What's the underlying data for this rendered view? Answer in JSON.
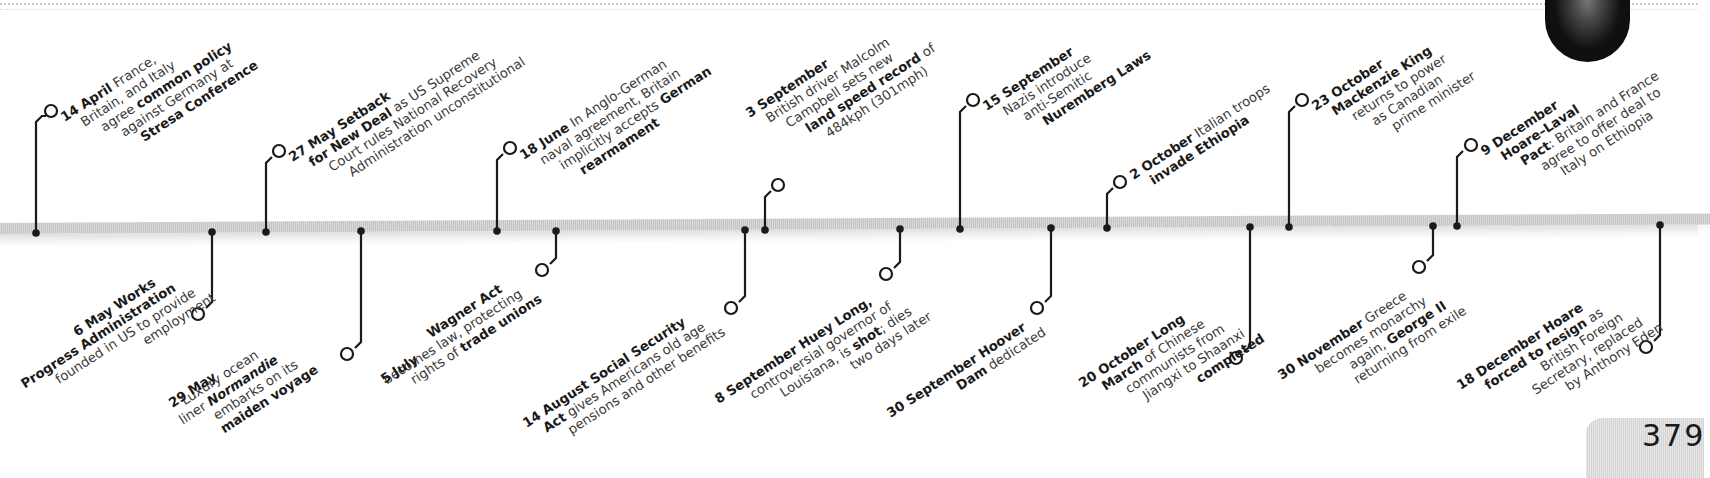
{
  "page": {
    "number": "379",
    "year_context": "1935",
    "accent_color": "#1a1a1a",
    "bar_color": "#cccccc"
  },
  "events_above": [
    {
      "date": "14 April",
      "lines": [
        [
          {
            "t": "14 April",
            "b": true
          },
          {
            "t": " France,",
            "b": false
          }
        ],
        [
          {
            "t": "Britain, and Italy",
            "b": false
          }
        ],
        [
          {
            "t": "agree ",
            "b": false
          },
          {
            "t": "common policy",
            "b": true
          }
        ],
        [
          {
            "t": "against Germany at",
            "b": false
          }
        ],
        [
          {
            "t": "Stresa Conference",
            "b": true
          }
        ]
      ]
    },
    {
      "date": "27 May",
      "lines": [
        [
          {
            "t": "27 May Setback",
            "b": true
          }
        ],
        [
          {
            "t": "for New Deal",
            "b": true
          },
          {
            "t": " as US Supreme",
            "b": false
          }
        ],
        [
          {
            "t": "Court rules National Recovery",
            "b": false
          }
        ],
        [
          {
            "t": "Administration unconstitutional",
            "b": false
          }
        ]
      ]
    },
    {
      "date": "18 June",
      "lines": [
        [
          {
            "t": "18 June",
            "b": true
          },
          {
            "t": " In Anglo-German",
            "b": false
          }
        ],
        [
          {
            "t": "naval agreement, Britain",
            "b": false
          }
        ],
        [
          {
            "t": "implicitly accepts ",
            "b": false
          },
          {
            "t": "German",
            "b": true
          }
        ],
        [
          {
            "t": "rearmament",
            "b": true
          }
        ]
      ]
    },
    {
      "date": "3 September",
      "lines": [
        [
          {
            "t": "3 September",
            "b": true
          }
        ],
        [
          {
            "t": "British driver Malcolm",
            "b": false
          }
        ],
        [
          {
            "t": "Campbell sets new",
            "b": false
          }
        ],
        [
          {
            "t": "land speed record",
            "b": true
          },
          {
            "t": " of",
            "b": false
          }
        ],
        [
          {
            "t": "484kph (301mph)",
            "b": false
          }
        ]
      ]
    },
    {
      "date": "15 September",
      "lines": [
        [
          {
            "t": "15 September",
            "b": true
          }
        ],
        [
          {
            "t": "Nazis introduce",
            "b": false
          }
        ],
        [
          {
            "t": "anti-Semitic",
            "b": false
          }
        ],
        [
          {
            "t": "Nuremberg Laws",
            "b": true
          }
        ]
      ]
    },
    {
      "date": "2 October",
      "lines": [
        [
          {
            "t": "2 October",
            "b": true
          },
          {
            "t": " Italian troops",
            "b": false
          }
        ],
        [
          {
            "t": "invade Ethiopia",
            "b": true
          }
        ]
      ]
    },
    {
      "date": "23 October",
      "lines": [
        [
          {
            "t": "23 October",
            "b": true
          }
        ],
        [
          {
            "t": "Mackenzie King",
            "b": true
          }
        ],
        [
          {
            "t": "returns to power",
            "b": false
          }
        ],
        [
          {
            "t": "as Canadian",
            "b": false
          }
        ],
        [
          {
            "t": "prime minister",
            "b": false
          }
        ]
      ]
    },
    {
      "date": "9 December",
      "lines": [
        [
          {
            "t": "9 December",
            "b": true
          }
        ],
        [
          {
            "t": "Hoare–Laval",
            "b": true
          }
        ],
        [
          {
            "t": "Pact",
            "b": true
          },
          {
            "t": ": Britain and France",
            "b": false
          }
        ],
        [
          {
            "t": "agree to offer deal to",
            "b": false
          }
        ],
        [
          {
            "t": "Italy on Ethiopia",
            "b": false
          }
        ]
      ]
    }
  ],
  "events_below": [
    {
      "date": "6 May",
      "lines": [
        [
          {
            "t": "6 May Works",
            "b": true
          }
        ],
        [
          {
            "t": "Progress Administration",
            "b": true
          }
        ],
        [
          {
            "t": "founded in US to provide",
            "b": false
          }
        ],
        [
          {
            "t": "employment",
            "b": false
          }
        ]
      ]
    },
    {
      "date": "29 May",
      "lines": [
        [
          {
            "t": "Luxury ocean",
            "b": false
          }
        ],
        [
          {
            "t": "liner ",
            "b": false
          },
          {
            "t": "Normandie",
            "b": true
          }
        ],
        [
          {
            "t": "embarks on its",
            "b": false
          }
        ],
        [
          {
            "t": "maiden voyage",
            "b": true
          }
        ]
      ],
      "lead": "29 May"
    },
    {
      "date": "5 July",
      "lines": [
        [
          {
            "t": "Wagner Act",
            "b": true
          }
        ],
        [
          {
            "t": "becomes law, protecting",
            "b": false
          }
        ],
        [
          {
            "t": "rights of ",
            "b": false
          },
          {
            "t": "trade unions",
            "b": true
          }
        ]
      ],
      "lead": "5 July In US,"
    },
    {
      "date": "14 August",
      "lines": [
        [
          {
            "t": "14 August Social Security",
            "b": true
          }
        ],
        [
          {
            "t": "Act",
            "b": true
          },
          {
            "t": " gives Americans old age",
            "b": false
          }
        ],
        [
          {
            "t": "pensions and other benefits",
            "b": false
          }
        ]
      ]
    },
    {
      "date": "8 September",
      "lines": [
        [
          {
            "t": "8 September Huey Long,",
            "b": true
          }
        ],
        [
          {
            "t": "controversial governor of",
            "b": false
          }
        ],
        [
          {
            "t": "Louisiana, is ",
            "b": false
          },
          {
            "t": "shot",
            "b": true
          },
          {
            "t": "; dies",
            "b": false
          }
        ],
        [
          {
            "t": "two days later",
            "b": false
          }
        ]
      ]
    },
    {
      "date": "30 September",
      "lines": [
        [
          {
            "t": "30 September Hoover",
            "b": true
          }
        ],
        [
          {
            "t": "Dam",
            "b": true
          },
          {
            "t": " dedicated",
            "b": false
          }
        ]
      ]
    },
    {
      "date": "20 October",
      "lines": [
        [
          {
            "t": "20 October Long",
            "b": true
          }
        ],
        [
          {
            "t": "March",
            "b": true
          },
          {
            "t": " of Chinese",
            "b": false
          }
        ],
        [
          {
            "t": "communists from",
            "b": false
          }
        ],
        [
          {
            "t": "Jiangxi to Shaanxi",
            "b": false
          }
        ],
        [
          {
            "t": "completed",
            "b": true
          }
        ]
      ]
    },
    {
      "date": "30 November",
      "lines": [
        [
          {
            "t": "30 November",
            "b": true
          },
          {
            "t": " Greece",
            "b": false
          }
        ],
        [
          {
            "t": "becomes monarchy",
            "b": false
          }
        ],
        [
          {
            "t": "again, ",
            "b": false
          },
          {
            "t": "George II",
            "b": true
          }
        ],
        [
          {
            "t": "returning from exile",
            "b": false
          }
        ]
      ]
    },
    {
      "date": "18 December",
      "lines": [
        [
          {
            "t": "18 December Hoare",
            "b": true
          }
        ],
        [
          {
            "t": "forced to resign",
            "b": true
          },
          {
            "t": " as",
            "b": false
          }
        ],
        [
          {
            "t": "British Foreign",
            "b": false
          }
        ],
        [
          {
            "t": "Secretary, replaced",
            "b": false
          }
        ],
        [
          {
            "t": "by Anthony Eden",
            "b": false
          }
        ]
      ]
    }
  ]
}
